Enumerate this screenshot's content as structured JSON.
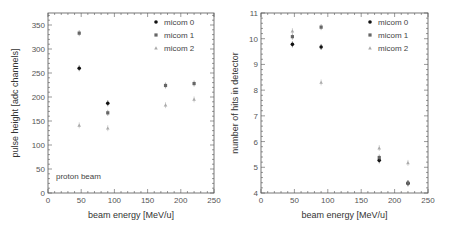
{
  "chart_data": [
    {
      "type": "scatter",
      "title": "",
      "xlabel": "beam energy [MeV/u]",
      "ylabel": "pulse height [adc channels]",
      "xlim": [
        0,
        250
      ],
      "ylim": [
        0,
        375
      ],
      "xticks": [
        0,
        50,
        100,
        150,
        200,
        250
      ],
      "yticks": [
        0,
        50,
        100,
        150,
        200,
        250,
        300,
        350
      ],
      "grid": false,
      "legend_position": "upper right",
      "annotation": "proton beam",
      "series": [
        {
          "name": "micom 0",
          "color": "#111111",
          "marker": "circle",
          "x": [
            47,
            90
          ],
          "y": [
            260,
            187
          ]
        },
        {
          "name": "micom 1",
          "color": "#666666",
          "marker": "square",
          "x": [
            47,
            90,
            177,
            220
          ],
          "y": [
            333,
            167,
            224,
            228
          ]
        },
        {
          "name": "micom 2",
          "color": "#aaaaaa",
          "marker": "triangle",
          "x": [
            47,
            90,
            177,
            220
          ],
          "y": [
            141,
            135,
            183,
            195
          ]
        }
      ]
    },
    {
      "type": "scatter",
      "title": "",
      "xlabel": "beam energy [MeV/u]",
      "ylabel": "number of hits in detector",
      "xlim": [
        0,
        250
      ],
      "ylim": [
        4,
        11
      ],
      "xticks": [
        0,
        50,
        100,
        150,
        200,
        250
      ],
      "yticks": [
        4,
        5,
        6,
        7,
        8,
        9,
        10,
        11
      ],
      "grid": false,
      "legend_position": "upper right",
      "series": [
        {
          "name": "micom 0",
          "color": "#111111",
          "marker": "circle",
          "x": [
            47,
            90,
            177,
            220
          ],
          "y": [
            9.78,
            9.68,
            5.27,
            4.38
          ]
        },
        {
          "name": "micom 1",
          "color": "#666666",
          "marker": "square",
          "x": [
            47,
            90,
            177,
            220
          ],
          "y": [
            10.08,
            10.45,
            5.38,
            4.38
          ]
        },
        {
          "name": "micom 2",
          "color": "#aaaaaa",
          "marker": "triangle",
          "x": [
            47,
            90,
            177,
            220
          ],
          "y": [
            10.3,
            8.3,
            5.75,
            5.17
          ]
        }
      ]
    }
  ]
}
